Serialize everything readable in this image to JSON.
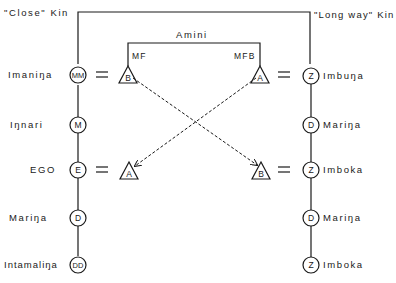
{
  "diagram": {
    "headers": {
      "left": "\"Close\" Kin",
      "right": "\"Long way\" Kin"
    },
    "bracket": {
      "label": "Amini",
      "left_label": "MF",
      "right_label": "MFB"
    },
    "left_column": [
      {
        "name": "Imaniŋa",
        "symbol": "MM",
        "shape": "circle"
      },
      {
        "name": "Iŋnari",
        "symbol": "M",
        "shape": "circle"
      },
      {
        "name": "EGO",
        "symbol": "E",
        "shape": "circle"
      },
      {
        "name": "Mariŋa",
        "symbol": "D",
        "shape": "circle"
      },
      {
        "name": "Intamaliŋa",
        "symbol": "DD",
        "shape": "circle"
      }
    ],
    "right_column": [
      {
        "name": "Imbuŋa",
        "symbol": "Z",
        "shape": "circle"
      },
      {
        "name": "Mariŋa",
        "symbol": "D",
        "shape": "circle"
      },
      {
        "name": "Imboka",
        "symbol": "Z",
        "shape": "circle"
      },
      {
        "name": "Mariŋa",
        "symbol": "D",
        "shape": "circle"
      },
      {
        "name": "Imboka",
        "symbol": "Z",
        "shape": "circle"
      }
    ],
    "spouses": [
      {
        "row": 0,
        "side": "left",
        "symbol": "B",
        "shape": "triangle"
      },
      {
        "row": 0,
        "side": "right",
        "symbol": "A",
        "shape": "triangle"
      },
      {
        "row": 2,
        "side": "left",
        "symbol": "A",
        "shape": "triangle"
      },
      {
        "row": 2,
        "side": "right",
        "symbol": "B",
        "shape": "triangle"
      }
    ],
    "marriage_symbol": "=",
    "arrows": [
      {
        "from": "B (MF)",
        "to": "B (row EGO, right)",
        "style": "dashed"
      },
      {
        "from": "A (MFB)",
        "to": "A (row EGO, left)",
        "style": "dashed"
      }
    ]
  }
}
